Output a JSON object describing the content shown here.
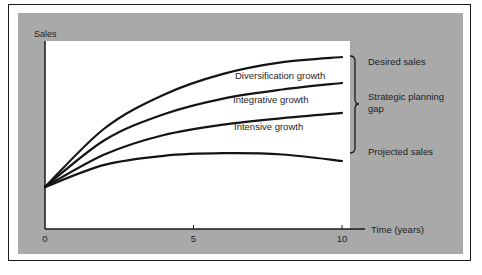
{
  "chart_data": {
    "type": "line",
    "title": "",
    "ylabel": "Sales",
    "xlabel": "Time (years)",
    "xlim": [
      0,
      10
    ],
    "x_ticks": [
      "0",
      "5",
      "10"
    ],
    "grid": false,
    "y_units": "relative sales (no numeric scale shown)",
    "series": [
      {
        "name": "Desired sales",
        "x": [
          0,
          2,
          4,
          6,
          8,
          10
        ],
        "values": [
          0,
          45,
          71,
          87,
          96,
          100
        ]
      },
      {
        "name": "Diversification growth ceiling",
        "x": [
          0,
          2,
          4,
          6,
          8,
          10
        ],
        "values": [
          0,
          36,
          56,
          68,
          75,
          80
        ]
      },
      {
        "name": "Integrative growth ceiling",
        "x": [
          0,
          2,
          4,
          6,
          8,
          10
        ],
        "values": [
          0,
          25,
          40,
          48,
          53,
          57
        ]
      },
      {
        "name": "Projected sales",
        "x": [
          0,
          2,
          4,
          6,
          8,
          10
        ],
        "values": [
          0,
          17,
          24,
          26,
          25,
          20
        ]
      }
    ],
    "band_labels": [
      "Diversification growth",
      "Integrative growth",
      "Intensive growth"
    ],
    "annotations": {
      "desired": "Desired sales",
      "gap_line1": "Strategic planning",
      "gap_line2": "gap",
      "projected": "Projected sales"
    }
  }
}
